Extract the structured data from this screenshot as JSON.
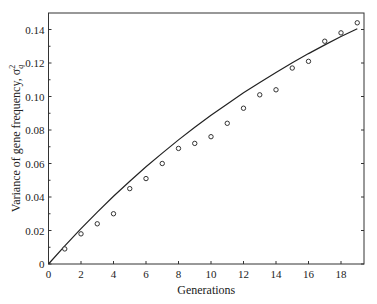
{
  "chart_data": {
    "type": "scatter",
    "title": "",
    "xlabel": "Generations",
    "ylabel": "Variance of gene frequency, σ",
    "ylabel_sup": "2",
    "ylabel_sub": "q",
    "xlim": [
      0,
      19.4
    ],
    "ylim": [
      0,
      0.15
    ],
    "grid": false,
    "legend": null,
    "x_ticks": [
      0,
      2,
      4,
      6,
      8,
      10,
      12,
      14,
      16,
      18
    ],
    "x_tick_labels": [
      "0",
      "2",
      "4",
      "6",
      "8",
      "10",
      "12",
      "14",
      "16",
      "18"
    ],
    "y_ticks": [
      0,
      0.02,
      0.04,
      0.06,
      0.08,
      0.1,
      0.12,
      0.14
    ],
    "y_tick_labels": [
      "0",
      "0.02",
      "0.04",
      "0.06",
      "0.08",
      "0.10",
      "0.12",
      "0.14"
    ],
    "y_minor_ticks": [
      0.01,
      0.03,
      0.05,
      0.07,
      0.09,
      0.11,
      0.13
    ],
    "series": [
      {
        "name": "Observed",
        "type": "scatter",
        "marker": "open-circle",
        "x": [
          1,
          2,
          3,
          4,
          5,
          6,
          7,
          8,
          9,
          10,
          11,
          12,
          13,
          14,
          15,
          16,
          17,
          18,
          19
        ],
        "values": [
          0.009,
          0.018,
          0.024,
          0.03,
          0.045,
          0.051,
          0.06,
          0.069,
          0.072,
          0.076,
          0.084,
          0.093,
          0.101,
          0.104,
          0.117,
          0.121,
          0.133,
          0.138,
          0.144
        ]
      },
      {
        "name": "Expected",
        "type": "line",
        "x": [
          0,
          1,
          2,
          3,
          4,
          5,
          6,
          7,
          8,
          9,
          10,
          11,
          12,
          13,
          14,
          15,
          16,
          17,
          18,
          19
        ],
        "values": [
          0.0,
          0.0108,
          0.0211,
          0.031,
          0.0404,
          0.0494,
          0.058,
          0.0662,
          0.0741,
          0.0816,
          0.0888,
          0.0956,
          0.1022,
          0.1084,
          0.1144,
          0.1201,
          0.1256,
          0.1308,
          0.1358,
          0.1405
        ]
      }
    ]
  }
}
